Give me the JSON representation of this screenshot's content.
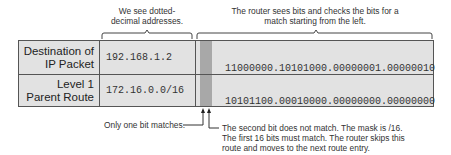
{
  "captions": {
    "dotted_decimal": "We see dotted-\ndecimal addresses.",
    "bits_check": "The router sees bits and checks the bits for a\nmatch starting from the left."
  },
  "table": {
    "rows": [
      {
        "label": "Destination of\nIP Packet",
        "dotted": "192.168.1.2",
        "binary_highlight": "11",
        "binary_rest": "000000.10101000.00000001.00000010"
      },
      {
        "label": "Level 1\nParent Route",
        "dotted": "172.16.0.0/16",
        "binary_highlight": "10",
        "binary_rest": "101100.00010000.00000000.00000000"
      }
    ]
  },
  "annotations": {
    "one_bit": "Only one bit matches.",
    "second_bit": "The second bit does not match. The mask is /16.\nThe first 16 bits must match. The router skips this\nroute and moves to the next route entry."
  },
  "colors": {
    "cell_bg": "#e2e2e2",
    "highlight": "#a8a8a8",
    "border": "#555555"
  }
}
